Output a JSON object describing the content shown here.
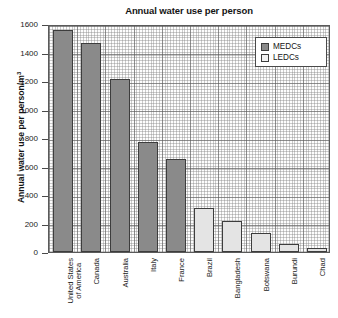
{
  "chart_data": {
    "type": "bar",
    "title": "Annual water use per person",
    "xlabel": "",
    "ylabel": "Annual water use per person/m",
    "ylabel_sup": "3",
    "ylim": [
      0,
      1600
    ],
    "yticks": [
      0,
      200,
      400,
      600,
      800,
      1000,
      1200,
      1400,
      1600
    ],
    "grid": true,
    "legend_position": "top-right",
    "categories": [
      "United States of America",
      "Canada",
      "Australia",
      "Italy",
      "France",
      "Brazil",
      "Bangladesh",
      "Botswana",
      "Burundi",
      "Chad"
    ],
    "category_lines": [
      [
        "United States",
        "of America"
      ],
      [
        "Canada"
      ],
      [
        "Australia"
      ],
      [
        "Italy"
      ],
      [
        "France"
      ],
      [
        "Brazil"
      ],
      [
        "Bangladesh"
      ],
      [
        "Botswana"
      ],
      [
        "Burundi"
      ],
      [
        "Chad"
      ]
    ],
    "values": [
      1560,
      1470,
      1215,
      770,
      650,
      310,
      220,
      135,
      55,
      30
    ],
    "groups": [
      "MEDCs",
      "MEDCs",
      "MEDCs",
      "MEDCs",
      "MEDCs",
      "LEDCs",
      "LEDCs",
      "LEDCs",
      "LEDCs",
      "LEDCs"
    ],
    "legend": [
      {
        "label": "MEDCs",
        "color": "#8a8a8a"
      },
      {
        "label": "LEDCs",
        "color": "#f2f2f2"
      }
    ]
  }
}
